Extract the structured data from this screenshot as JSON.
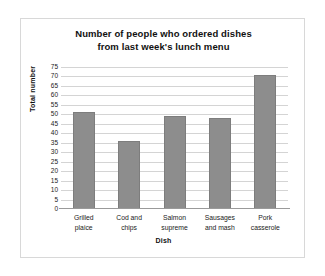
{
  "figure": {
    "background_color": "#ffffff",
    "border_color": "#d8d8d8",
    "bar_color": "#8d8d8d",
    "gridline_color": "#d4d4d4",
    "axis_color": "#9a9a9a"
  },
  "chart_data": {
    "type": "bar",
    "title": "Number of people who ordered dishes from last week's lunch menu",
    "title_lines": [
      "Number of people who ordered dishes",
      "from last week's lunch menu"
    ],
    "xlabel": "Dish",
    "ylabel": "Total number",
    "categories": [
      "Grilled plaice",
      "Cod and chips",
      "Salmon supreme",
      "Sausages and mash",
      "Pork casserole"
    ],
    "category_lines": [
      [
        "Grilled",
        "plaice"
      ],
      [
        "Cod and",
        "chips"
      ],
      [
        "Salmon",
        "supreme"
      ],
      [
        "Sausages",
        "and mash"
      ],
      [
        "Pork",
        "casserole"
      ]
    ],
    "values": [
      51,
      36,
      49,
      48,
      71
    ],
    "ylim": [
      0,
      75
    ],
    "ytick_step": 5,
    "yticks": [
      0,
      5,
      10,
      15,
      20,
      25,
      30,
      35,
      40,
      45,
      50,
      55,
      60,
      65,
      70,
      75
    ],
    "ytick_labels": [
      "0",
      "5",
      "10",
      "15",
      "20",
      "25",
      "30",
      "35",
      "40",
      "45",
      "50",
      "55",
      "60",
      "65",
      "70",
      "75"
    ],
    "grid": true,
    "grid_axis": "y",
    "legend": false,
    "legend_position": "none"
  }
}
